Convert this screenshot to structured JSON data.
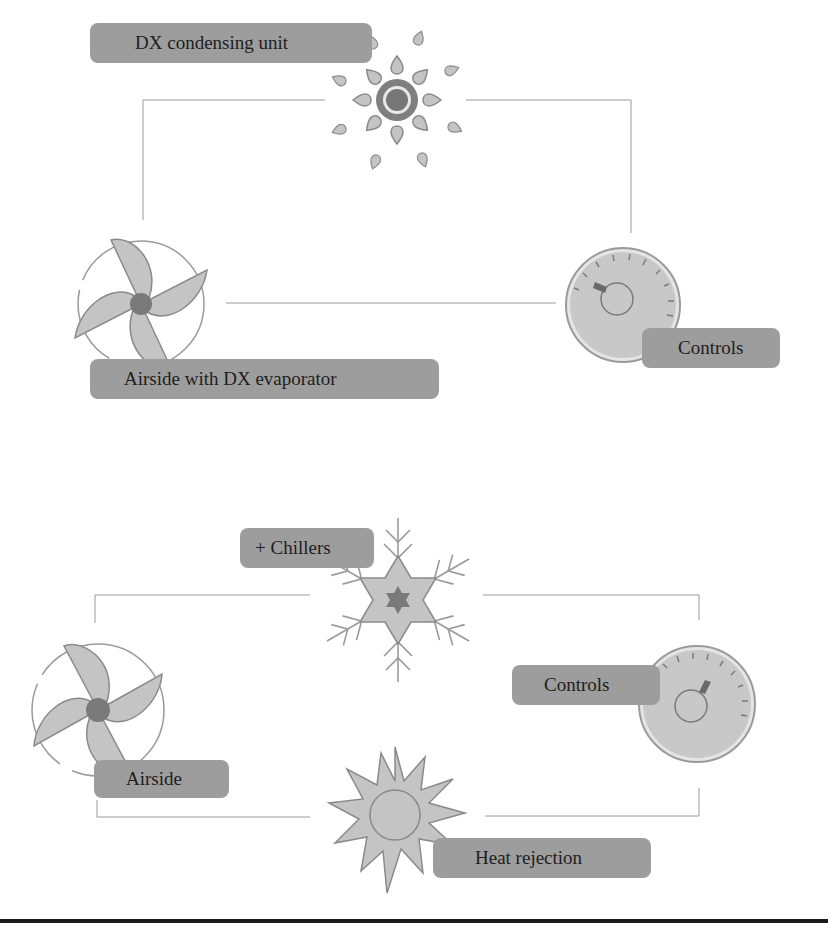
{
  "diagram": {
    "top": {
      "title": "DX-based system",
      "components": [
        {
          "id": "condensing_unit",
          "label": "DX condensing unit",
          "icon": "sun-icon"
        },
        {
          "id": "airside",
          "label": "Airside with DX evaporator",
          "icon": "fan-icon"
        },
        {
          "id": "controls",
          "label": "Controls",
          "icon": "gauge-icon"
        }
      ]
    },
    "bottom": {
      "title": "Chilled water system",
      "components": [
        {
          "id": "chillers",
          "label": "+ Chillers",
          "icon": "snowflake-icon"
        },
        {
          "id": "airside",
          "label": "Airside",
          "icon": "fan-icon"
        },
        {
          "id": "controls",
          "label": "Controls",
          "icon": "gauge-icon"
        },
        {
          "id": "heat_rejection",
          "label": "Heat rejection",
          "icon": "starburst-icon"
        }
      ]
    },
    "colors": {
      "label_bg": "#9d9d9d",
      "icon_fill": "#c4c4c4",
      "icon_stroke": "#8a8a8a",
      "hub": "#7a7a7a",
      "line": "#9a9a9a",
      "rule": "#1a1a1a"
    }
  }
}
